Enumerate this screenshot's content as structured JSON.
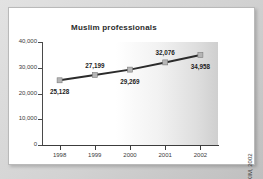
{
  "card": {
    "source_note": "Source: IKIM, 2002"
  },
  "chart_data": {
    "type": "line",
    "title": "Muslim professionals",
    "xlabel": "",
    "ylabel": "",
    "categories": [
      "1998",
      "1999",
      "2000",
      "2001",
      "2002"
    ],
    "values": [
      25128,
      27199,
      29269,
      32076,
      34958
    ],
    "point_labels": [
      "25,128",
      "27,199",
      "29,269",
      "32,076",
      "34,958"
    ],
    "ylim": [
      0,
      40000
    ],
    "yticks": [
      40000,
      30000,
      20000,
      10000,
      0
    ],
    "ytick_labels": [
      "40,000",
      "30,000",
      "20,000",
      "10,000",
      "0"
    ],
    "grid": false,
    "legend": "none",
    "series": [
      {
        "name": "Muslim professionals",
        "values": [
          25128,
          27199,
          29269,
          32076,
          34958
        ],
        "line_color": "#2b2b2b",
        "marker_color": "#b5b5b5",
        "marker_shape": "square"
      }
    ],
    "colors": {
      "line": "#2b2b2b",
      "marker": "#b5b5b5",
      "axis": "#3c3c3c",
      "label_text": "#1c1c1c",
      "plot_background_left": "#ffffff",
      "plot_background_right": "#cfcfcf",
      "card_background": "#ffffff",
      "frame_background": "#d8d8d8"
    }
  }
}
